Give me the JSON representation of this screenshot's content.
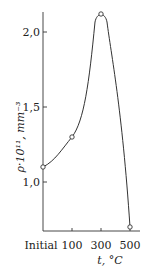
{
  "chart_data": {
    "type": "line",
    "title": "",
    "xlabel": "t, °C",
    "ylabel": "ρ·10¹¹, mm⁻³",
    "categories": [
      "Initial",
      "100",
      "300",
      "500"
    ],
    "series": [
      {
        "name": "ρ",
        "values": [
          1.1,
          1.3,
          2.12,
          0.7
        ]
      }
    ],
    "ylim": [
      0.67,
      2.13
    ],
    "yticks": [
      1.0,
      1.5,
      2.0
    ],
    "ytick_labels": [
      "1,0",
      "1,5",
      "2,0"
    ],
    "grid": false,
    "legend": "none",
    "markers": "open-circle",
    "curve": "smooth"
  }
}
